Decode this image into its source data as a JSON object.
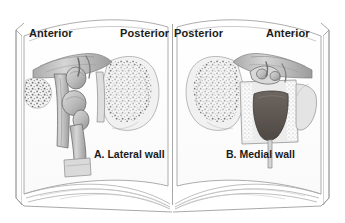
{
  "figure": {
    "type": "anatomical-illustration-open-book",
    "background_color": "#ffffff",
    "line_color": "#8c8c8c",
    "text_color": "#1c1c1c",
    "illustration_tones": {
      "light_gray": "#e6e6e6",
      "mid_gray": "#b8b8b8",
      "dark_gray": "#6e6a66",
      "cavity_dark": "#5c5550",
      "outline": "#4a4a4a"
    }
  },
  "pages": [
    {
      "id": "left-page",
      "orientation_labels": {
        "left": "Anterior",
        "right": "Posterior"
      },
      "caption": "A. Lateral wall"
    },
    {
      "id": "right-page",
      "orientation_labels": {
        "left": "Posterior",
        "right": "Anterior"
      },
      "caption": "B. Medial wall"
    }
  ]
}
